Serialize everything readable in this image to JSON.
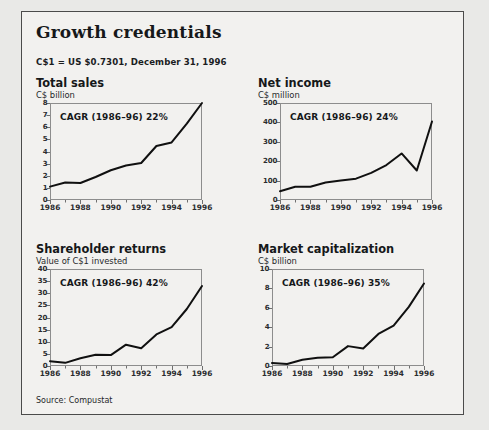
{
  "panel": {
    "title": "Growth credentials",
    "fx_note": "C$1 = US $0.7301, December 31, 1996",
    "source": "Source: Compustat",
    "border_color": "#4b4b4b",
    "background_color": "#f2f1ef",
    "line_color": "#101010"
  },
  "chart_data": [
    {
      "id": "total-sales",
      "type": "line",
      "title": "Total sales",
      "subtitle": "C$ billion",
      "ylabel": "C$ billion",
      "xlabel": "",
      "annotation": "CAGR (1986–96) 22%",
      "x": [
        1986,
        1987,
        1988,
        1989,
        1990,
        1991,
        1992,
        1993,
        1994,
        1995,
        1996
      ],
      "values": [
        1.1,
        1.45,
        1.4,
        1.9,
        2.45,
        2.85,
        3.05,
        4.45,
        4.75,
        6.3,
        8.0
      ],
      "xlim": [
        1986,
        1996
      ],
      "ylim": [
        0,
        8
      ],
      "yticks": [
        0,
        1,
        2,
        3,
        4,
        5,
        6,
        7,
        8
      ],
      "xticks": [
        1986,
        1988,
        1990,
        1992,
        1994,
        1996
      ],
      "xticklabels": [
        "1986",
        "1988",
        "1990",
        "1992",
        "1994",
        "1996"
      ],
      "grid": false,
      "legend": "none"
    },
    {
      "id": "net-income",
      "type": "line",
      "title": "Net income",
      "subtitle": "C$ million",
      "ylabel": "C$ million",
      "xlabel": "",
      "annotation": "CAGR (1986–96) 24%",
      "x": [
        1986,
        1987,
        1988,
        1989,
        1990,
        1991,
        1992,
        1993,
        1994,
        1995,
        1996
      ],
      "values": [
        45,
        68,
        68,
        90,
        100,
        110,
        140,
        180,
        240,
        152,
        405
      ],
      "xlim": [
        1986,
        1996
      ],
      "ylim": [
        0,
        500
      ],
      "yticks": [
        0,
        100,
        200,
        300,
        400,
        500
      ],
      "xticks": [
        1986,
        1988,
        1990,
        1992,
        1994,
        1996
      ],
      "xticklabels": [
        "1986",
        "1988",
        "1990",
        "1992",
        "1994",
        "1996"
      ],
      "grid": false,
      "legend": "none"
    },
    {
      "id": "shareholder-returns",
      "type": "line",
      "title": "Shareholder returns",
      "subtitle": "Value of C$1 invested",
      "ylabel": "Value of C$1 invested",
      "xlabel": "",
      "annotation": "CAGR (1986–96) 42%",
      "x": [
        1986,
        1987,
        1988,
        1989,
        1990,
        1991,
        1992,
        1993,
        1994,
        1995,
        1996
      ],
      "values": [
        2.0,
        1.3,
        3.2,
        4.6,
        4.5,
        8.8,
        7.3,
        13.0,
        16.0,
        23.5,
        33.0
      ],
      "xlim": [
        1986,
        1996
      ],
      "ylim": [
        0,
        40
      ],
      "yticks": [
        0,
        5,
        10,
        15,
        20,
        25,
        30,
        35,
        40
      ],
      "xticks": [
        1986,
        1988,
        1990,
        1992,
        1994,
        1996
      ],
      "xticklabels": [
        "1986",
        "1988",
        "1990",
        "1992",
        "1994",
        "1996"
      ],
      "grid": false,
      "legend": "none"
    },
    {
      "id": "market-capitalization",
      "type": "line",
      "title": "Market capitalization",
      "subtitle": "C$ billion",
      "ylabel": "C$ billion",
      "xlabel": "",
      "annotation": "CAGR (1986–96) 35%",
      "x": [
        1986,
        1987,
        1988,
        1989,
        1990,
        1991,
        1992,
        1993,
        1994,
        1995,
        1996
      ],
      "values": [
        0.3,
        0.2,
        0.65,
        0.85,
        0.9,
        2.05,
        1.8,
        3.3,
        4.15,
        6.1,
        8.5
      ],
      "xlim": [
        1986,
        1996
      ],
      "ylim": [
        0,
        10
      ],
      "yticks": [
        0,
        2,
        4,
        6,
        8,
        10
      ],
      "xticks": [
        1986,
        1988,
        1990,
        1992,
        1994,
        1996
      ],
      "xticklabels": [
        "1986",
        "1988",
        "1990",
        "1992",
        "1994",
        "1996"
      ],
      "grid": false,
      "legend": "none"
    }
  ]
}
